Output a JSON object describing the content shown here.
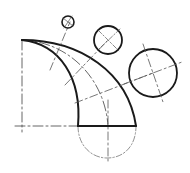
{
  "diagram": {
    "type": "technical-drawing",
    "colors": {
      "background": "#ffffff",
      "outline": "#1a1a1a",
      "centerline": "#555555",
      "hidden": "#777777"
    },
    "outline": {
      "top_left_corner": [
        22,
        40
      ],
      "bottom_left": [
        78,
        126
      ],
      "bottom_right": [
        136,
        126
      ]
    },
    "sections": [
      {
        "name": "small-section",
        "center": [
          68,
          22
        ],
        "radius": 6
      },
      {
        "name": "medium-section",
        "center": [
          108,
          40
        ],
        "radius": 14
      },
      {
        "name": "large-section",
        "center": [
          153,
          73
        ],
        "radius": 24
      }
    ],
    "centerlines": {
      "vertical_left_x": 22,
      "horizontal_bottom_y": 126,
      "vertical_bottom_x": 108
    },
    "base_arc": {
      "center": [
        107,
        126
      ],
      "radius": 30
    }
  }
}
